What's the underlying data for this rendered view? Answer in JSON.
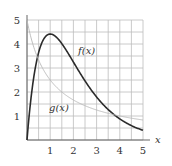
{
  "chart_data": {
    "type": "line",
    "title": "",
    "xlabel": "x",
    "ylabel": "",
    "xlim": [
      0,
      5
    ],
    "ylim": [
      0,
      5
    ],
    "grid": true,
    "grid_step": 0.5,
    "x_ticks": [
      "1",
      "2",
      "3",
      "4",
      "5"
    ],
    "y_ticks": [
      "1",
      "2",
      "3",
      "4",
      "5"
    ],
    "x": [
      0,
      0.25,
      0.5,
      0.75,
      1,
      1.5,
      2,
      2.5,
      3,
      3.5,
      4,
      4.5,
      5
    ],
    "series": [
      {
        "name": "f(x)",
        "color": "#2b2b2b",
        "values": [
          0,
          2.34,
          3.64,
          4.25,
          4.41,
          4.02,
          3.25,
          2.46,
          1.79,
          1.27,
          0.88,
          0.6,
          0.4
        ]
      },
      {
        "name": "g(x)",
        "color": "#b8b8b8",
        "values": [
          5,
          4.0,
          3.33,
          2.86,
          2.5,
          2.0,
          1.67,
          1.43,
          1.25,
          1.11,
          1.0,
          0.91,
          0.83
        ]
      }
    ],
    "annotations": [
      {
        "text": "f(x)",
        "x": 2.2,
        "y": 3.6
      },
      {
        "text": "g(x)",
        "x": 0.95,
        "y": 1.2
      }
    ]
  }
}
